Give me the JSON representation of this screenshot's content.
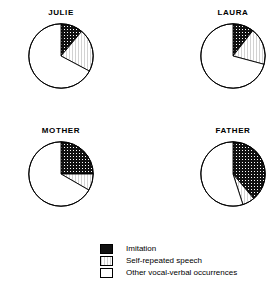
{
  "chart_data": {
    "type": "pie",
    "title": "",
    "legend_position": "bottom-center",
    "categories": [
      "Imitation",
      "Self-repeated speech",
      "Other vocal-verbal occurrences"
    ],
    "category_colors": [
      "#1a1a1a",
      "#e3e3e3",
      "#ffffff"
    ],
    "charts": [
      {
        "title": "JULIE",
        "start_angle_deg": 0,
        "direction": "clockwise",
        "slices": [
          {
            "label": "Imitation",
            "angle_deg": 40,
            "percent": 11
          },
          {
            "label": "Self-repeated speech",
            "angle_deg": 78,
            "percent": 22
          },
          {
            "label": "Other vocal-verbal occurrences",
            "angle_deg": 242,
            "percent": 67
          }
        ]
      },
      {
        "title": "LAURA",
        "start_angle_deg": 0,
        "direction": "clockwise",
        "slices": [
          {
            "label": "Imitation",
            "angle_deg": 38,
            "percent": 11
          },
          {
            "label": "Self-repeated speech",
            "angle_deg": 67,
            "percent": 19
          },
          {
            "label": "Other vocal-verbal occurrences",
            "angle_deg": 255,
            "percent": 70
          }
        ]
      },
      {
        "title": "MOTHER",
        "start_angle_deg": 0,
        "direction": "clockwise",
        "slices": [
          {
            "label": "Imitation",
            "angle_deg": 90,
            "percent": 25
          },
          {
            "label": "Self-repeated speech",
            "angle_deg": 30,
            "percent": 8
          },
          {
            "label": "Other vocal-verbal occurrences",
            "angle_deg": 240,
            "percent": 67
          }
        ]
      },
      {
        "title": "FATHER",
        "start_angle_deg": 0,
        "direction": "clockwise",
        "slices": [
          {
            "label": "Imitation",
            "angle_deg": 140,
            "percent": 39
          },
          {
            "label": "Self-repeated speech",
            "angle_deg": 22,
            "percent": 6
          },
          {
            "label": "Other vocal-verbal occurrences",
            "angle_deg": 198,
            "percent": 55
          }
        ]
      }
    ]
  },
  "pies": {
    "julie": {
      "title": "JULIE"
    },
    "laura": {
      "title": "LAURA"
    },
    "mother": {
      "title": "MOTHER"
    },
    "father": {
      "title": "FATHER"
    }
  },
  "legend": {
    "items": [
      {
        "label": "Imitation",
        "fill": "#1a1a1a"
      },
      {
        "label": "Self-repeated speech",
        "fill": "#e3e3e3"
      },
      {
        "label": "Other vocal-verbal occurrences",
        "fill": "#ffffff"
      }
    ]
  }
}
